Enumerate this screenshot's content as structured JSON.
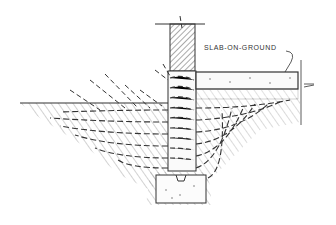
{
  "diagram": {
    "labels": {
      "slab": "SLAB-ON-GROUND"
    },
    "components": [
      "wall",
      "foundation-wall",
      "footing",
      "slab",
      "gravel-base",
      "ground",
      "heat-flow-lines"
    ],
    "colors": {
      "ink": "#333333",
      "hatch": "#555555",
      "background": "#ffffff"
    }
  }
}
